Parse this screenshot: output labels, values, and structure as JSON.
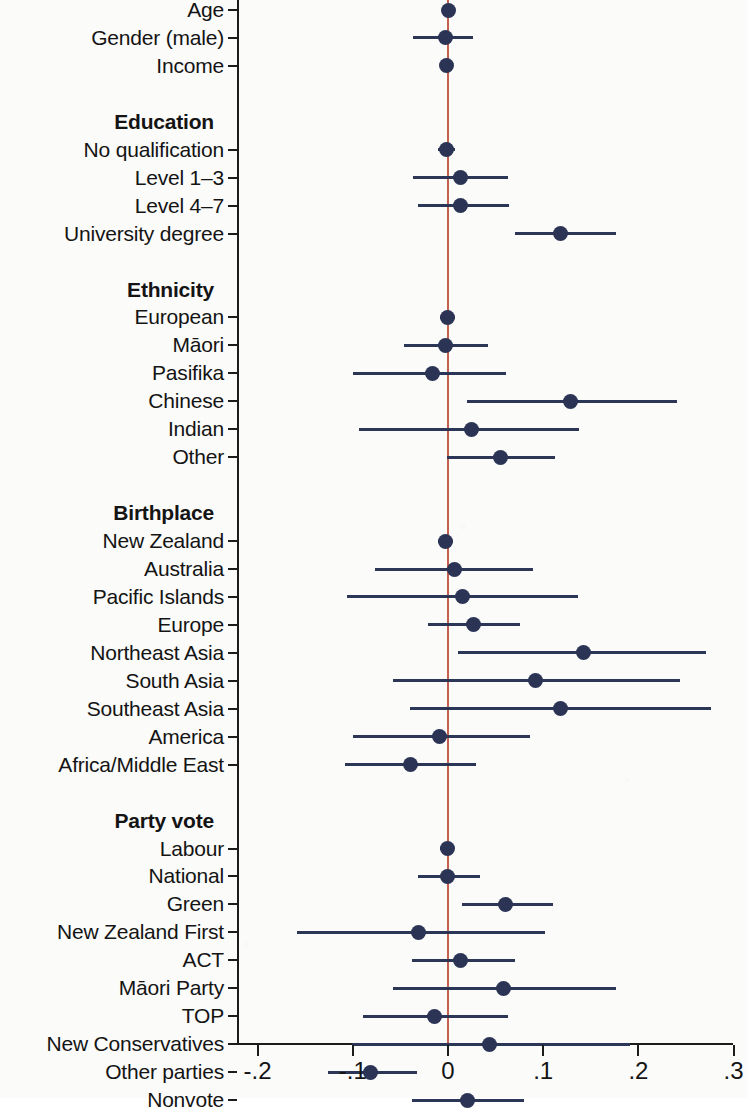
{
  "figure": {
    "type": "coefficient-forest-plot",
    "marker_color": "#2b3455",
    "ci_color": "#2c3657",
    "zero_line_color": "#c4604e",
    "axis_color": "#1c1c1c",
    "background": "#fbfbfa"
  },
  "chart_data": {
    "type": "scatter",
    "title": "",
    "xlabel": "",
    "ylabel": "",
    "xlim": [
      -0.25,
      0.32
    ],
    "grid": false,
    "legend": "none",
    "reference_line": 0,
    "xticks": [
      -0.2,
      -0.1,
      0,
      0.1,
      0.2,
      0.3
    ],
    "xticklabels": [
      "-.2",
      "-.1",
      "0",
      ".1",
      ".2",
      ".3"
    ],
    "rows": [
      {
        "kind": "item",
        "label": "Age",
        "estimate": 0.0,
        "ci_low": -0.004,
        "ci_high": 0.004
      },
      {
        "kind": "item",
        "label": "Gender (male)",
        "estimate": -0.003,
        "ci_low": -0.037,
        "ci_high": 0.026
      },
      {
        "kind": "item",
        "label": "Income",
        "estimate": -0.002,
        "ci_low": -0.006,
        "ci_high": 0.003
      },
      {
        "kind": "spacer",
        "label": ""
      },
      {
        "kind": "group",
        "label": "Education"
      },
      {
        "kind": "item",
        "label": "No qualification",
        "estimate": -0.002,
        "ci_low": -0.01,
        "ci_high": 0.007
      },
      {
        "kind": "item",
        "label": "Level 1–3",
        "estimate": 0.013,
        "ci_low": -0.037,
        "ci_high": 0.063
      },
      {
        "kind": "item",
        "label": "Level 4–7",
        "estimate": 0.013,
        "ci_low": -0.031,
        "ci_high": 0.064
      },
      {
        "kind": "item",
        "label": "University degree",
        "estimate": 0.118,
        "ci_low": 0.07,
        "ci_high": 0.176
      },
      {
        "kind": "spacer",
        "label": ""
      },
      {
        "kind": "group",
        "label": "Ethnicity"
      },
      {
        "kind": "item",
        "label": "European",
        "estimate": -0.001,
        "ci_low": -0.008,
        "ci_high": 0.007
      },
      {
        "kind": "item",
        "label": "Māori",
        "estimate": -0.003,
        "ci_low": -0.046,
        "ci_high": 0.042
      },
      {
        "kind": "item",
        "label": "Pasifika",
        "estimate": -0.016,
        "ci_low": -0.1,
        "ci_high": 0.061
      },
      {
        "kind": "item",
        "label": "Chinese",
        "estimate": 0.129,
        "ci_low": 0.02,
        "ci_high": 0.241
      },
      {
        "kind": "item",
        "label": "Indian",
        "estimate": 0.025,
        "ci_low": -0.094,
        "ci_high": 0.138
      },
      {
        "kind": "item",
        "label": "Other",
        "estimate": 0.055,
        "ci_low": -0.001,
        "ci_high": 0.112
      },
      {
        "kind": "spacer",
        "label": ""
      },
      {
        "kind": "group",
        "label": "Birthplace"
      },
      {
        "kind": "item",
        "label": "New Zealand",
        "estimate": -0.003,
        "ci_low": -0.01,
        "ci_high": 0.005
      },
      {
        "kind": "item",
        "label": "Australia",
        "estimate": 0.007,
        "ci_low": -0.077,
        "ci_high": 0.089
      },
      {
        "kind": "item",
        "label": "Pacific Islands",
        "estimate": 0.015,
        "ci_low": -0.106,
        "ci_high": 0.137
      },
      {
        "kind": "item",
        "label": "Europe",
        "estimate": 0.027,
        "ci_low": -0.021,
        "ci_high": 0.076
      },
      {
        "kind": "item",
        "label": "Northeast Asia",
        "estimate": 0.142,
        "ci_low": 0.011,
        "ci_high": 0.271
      },
      {
        "kind": "item",
        "label": "South Asia",
        "estimate": 0.092,
        "ci_low": -0.058,
        "ci_high": 0.244
      },
      {
        "kind": "item",
        "label": "Southeast Asia",
        "estimate": 0.118,
        "ci_low": -0.04,
        "ci_high": 0.276
      },
      {
        "kind": "item",
        "label": "America",
        "estimate": -0.009,
        "ci_low": -0.1,
        "ci_high": 0.086
      },
      {
        "kind": "item",
        "label": "Africa/Middle East",
        "estimate": -0.039,
        "ci_low": -0.108,
        "ci_high": 0.029
      },
      {
        "kind": "spacer",
        "label": ""
      },
      {
        "kind": "group",
        "label": "Party vote"
      },
      {
        "kind": "item",
        "label": "Labour",
        "estimate": -0.001,
        "ci_low": -0.008,
        "ci_high": 0.006
      },
      {
        "kind": "item",
        "label": "National",
        "estimate": -0.001,
        "ci_low": -0.032,
        "ci_high": 0.034
      },
      {
        "kind": "item",
        "label": "Green",
        "estimate": 0.06,
        "ci_low": 0.015,
        "ci_high": 0.11
      },
      {
        "kind": "item",
        "label": "New Zealand First",
        "estimate": -0.031,
        "ci_low": -0.159,
        "ci_high": 0.102
      },
      {
        "kind": "item",
        "label": "ACT",
        "estimate": 0.013,
        "ci_low": -0.038,
        "ci_high": 0.07
      },
      {
        "kind": "item",
        "label": "Māori Party",
        "estimate": 0.058,
        "ci_low": -0.058,
        "ci_high": 0.176
      },
      {
        "kind": "item",
        "label": "TOP",
        "estimate": -0.014,
        "ci_low": -0.089,
        "ci_high": 0.063
      },
      {
        "kind": "item",
        "label": "New Conservatives",
        "estimate": 0.044,
        "ci_low": -0.101,
        "ci_high": 0.191
      },
      {
        "kind": "item",
        "label": "Other parties",
        "estimate": -0.081,
        "ci_low": -0.126,
        "ci_high": -0.033
      },
      {
        "kind": "item",
        "label": "Nonvote",
        "estimate": 0.021,
        "ci_low": -0.038,
        "ci_high": 0.08
      }
    ]
  }
}
